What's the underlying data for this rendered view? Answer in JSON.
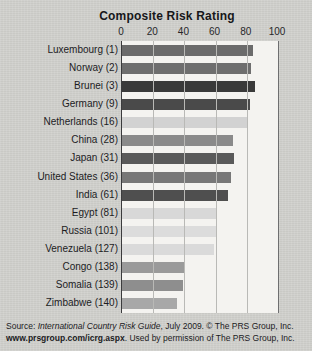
{
  "chart_data": {
    "type": "bar",
    "orientation": "horizontal",
    "title": "Composite Risk Rating",
    "xlabel": "",
    "ylabel": "",
    "xlim": [
      0,
      100
    ],
    "xticks": [
      0,
      20,
      40,
      60,
      80,
      100
    ],
    "grid": true,
    "legend": false,
    "categories": [
      "Luxembourg (1)",
      "Norway (2)",
      "Brunei (3)",
      "Germany (9)",
      "Netherlands (16)",
      "China (28)",
      "Japan (31)",
      "United States (36)",
      "India (61)",
      "Egypt (81)",
      "Russia (101)",
      "Venezuela (127)",
      "Congo (138)",
      "Somalia (139)",
      "Zimbabwe (140)"
    ],
    "values": [
      84,
      83,
      85,
      82,
      80,
      71,
      72,
      70,
      68,
      61,
      60,
      59,
      40,
      39,
      35
    ],
    "bar_colors": [
      "#6b6b6b",
      "#6e6e6e",
      "#3a3a3a",
      "#4a4a4a",
      "#d2d2d2",
      "#8a8a8a",
      "#5a5a5a",
      "#777777",
      "#4f4f4f",
      "#d8d8d8",
      "#dcdcdc",
      "#dadada",
      "#9a9a9a",
      "#8e8e8e",
      "#a8a8a8"
    ]
  },
  "footer": {
    "line1_prefix": "Source: ",
    "line1_italic": "International Country Risk Guide",
    "line1_suffix": ", July 2009. © The PRS Group, Inc.",
    "line2_bold": "www.prsgroup.com/icrg.aspx",
    "line2_rest": ". Used by permission of The PRS Group, Inc."
  }
}
